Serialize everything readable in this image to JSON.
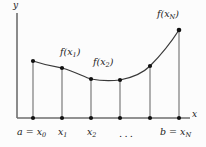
{
  "figure": {
    "background_color": "#fcfcfc",
    "axis_color": "#6e6e6e",
    "curve_color": "#3a3a3a",
    "ordinate_color": "#6e6e6e",
    "point_color": "#111111",
    "label_color": "#1a1a1a"
  },
  "axes": {
    "y_label": "y",
    "x_label": "x",
    "origin_px": {
      "x": 17,
      "y": 118
    },
    "x_axis_end_px": {
      "x": 190,
      "y": 118
    },
    "y_axis_top_px": {
      "x": 17,
      "y": 13
    }
  },
  "curve": {
    "shape": "convex-decreasing-then-increasing",
    "path": "M 33 61 C 48 66, 56 67, 62 68 C 76 72, 84 77, 91 79 C 101 81, 112 81, 120 80 C 136 77, 144 72, 150 66 C 160 56, 170 44, 179 30"
  },
  "ordinates": [
    {
      "name": "x0",
      "x_px": 33,
      "top_y_px": 61,
      "value_label": "a = x",
      "subscript": "0",
      "point_label": ""
    },
    {
      "name": "x1",
      "x_px": 62,
      "top_y_px": 68,
      "value_label": "x",
      "subscript": "1",
      "point_label": "f(x1)"
    },
    {
      "name": "x2",
      "x_px": 91,
      "top_y_px": 79,
      "value_label": "x",
      "subscript": "2",
      "point_label": "f(x2)"
    },
    {
      "name": "x3",
      "x_px": 120,
      "top_y_px": 80,
      "value_label": "",
      "subscript": "",
      "point_label": ""
    },
    {
      "name": "x4",
      "x_px": 150,
      "top_y_px": 66,
      "value_label": "",
      "subscript": "",
      "point_label": ""
    },
    {
      "name": "xN",
      "x_px": 179,
      "top_y_px": 30,
      "value_label": "b = x",
      "subscript": "N",
      "point_label": "f(xN)"
    }
  ],
  "labels": {
    "y_axis": "y",
    "x_axis": "x",
    "f_x1_prefix": "f(x",
    "f_x1_sub": "1",
    "f_x1_suffix": ")",
    "f_x2_prefix": "f(x",
    "f_x2_sub": "2",
    "f_x2_suffix": ")",
    "f_xN_prefix": "f(x",
    "f_xN_sub": "N",
    "f_xN_suffix": ")",
    "a_eq_prefix": "a = x",
    "a_eq_sub": "0",
    "x1_prefix": "x",
    "x1_sub": "1",
    "x2_prefix": "x",
    "x2_sub": "2",
    "b_eq_prefix": "b = x",
    "b_eq_sub": "N",
    "ellipsis": "..."
  }
}
